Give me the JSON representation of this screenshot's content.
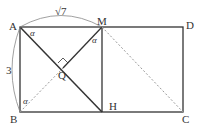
{
  "diagram": {
    "type": "geometry",
    "points": {
      "A": {
        "label": "A",
        "x": 20,
        "y": 27
      },
      "M": {
        "label": "M",
        "x": 102,
        "y": 27
      },
      "D": {
        "label": "D",
        "x": 183,
        "y": 27
      },
      "B": {
        "label": "B",
        "x": 20,
        "y": 112
      },
      "H": {
        "label": "H",
        "x": 102,
        "y": 112
      },
      "C": {
        "label": "C",
        "x": 183,
        "y": 112
      },
      "Q": {
        "label": "Q",
        "x": 63,
        "y": 70
      }
    },
    "measurements": {
      "AM": "√7",
      "AB": "3"
    },
    "angles": {
      "at_A": "α",
      "at_M": "α",
      "at_B": "α"
    },
    "colors": {
      "solid_line": "#333333",
      "dashed_line": "#999999",
      "arc": "#888888"
    }
  }
}
